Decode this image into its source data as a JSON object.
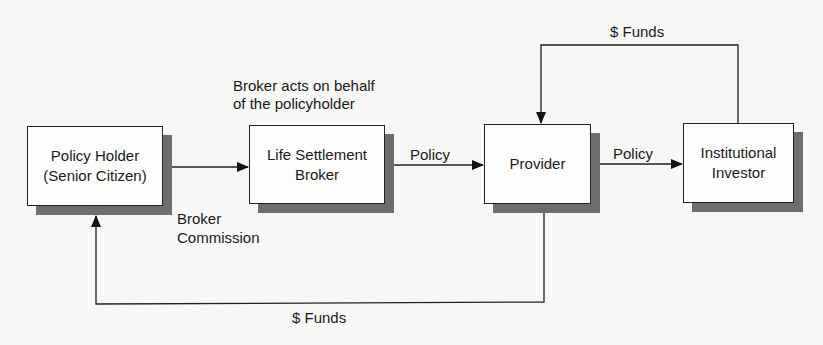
{
  "nodes": {
    "policy_holder": {
      "line1": "Policy Holder",
      "line2": "(Senior Citizen)"
    },
    "broker": {
      "line1": "Life Settlement",
      "line2": "Broker"
    },
    "provider": {
      "line1": "Provider"
    },
    "investor": {
      "line1": "Institutional",
      "line2": "Investor"
    }
  },
  "edges": {
    "broker_policy": "Policy",
    "provider_policy": "Policy",
    "funds_top": "$ Funds",
    "funds_bottom": "$ Funds",
    "broker_note_line1": "Broker acts on behalf",
    "broker_note_line2": "of the policyholder",
    "commission_line1": "Broker",
    "commission_line2": "Commission"
  }
}
